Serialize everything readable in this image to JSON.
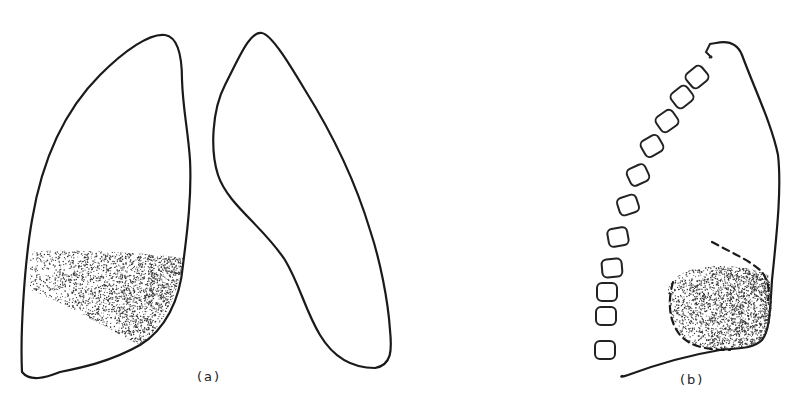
{
  "figure": {
    "panels": [
      {
        "id": "a",
        "label": "(a)",
        "description": "Frontal view of both lungs with stippled opacity in lower zone of left-side lung"
      },
      {
        "id": "b",
        "label": "(b)",
        "description": "Lateral view of lung with vertebrae and dashed boundary around stippled posterior-basal opacity"
      }
    ],
    "colors": {
      "line": "#1a1a1a",
      "stipple": "#333333",
      "background": "#ffffff"
    }
  }
}
